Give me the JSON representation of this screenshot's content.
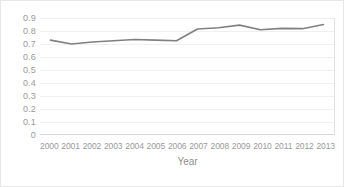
{
  "chart_data": {
    "type": "line",
    "title": "",
    "xlabel": "Year",
    "ylabel": "",
    "categories": [
      "2000",
      "2001",
      "2002",
      "2003",
      "2004",
      "2005",
      "2006",
      "2007",
      "2008",
      "2009",
      "2010",
      "2011",
      "2012",
      "2013"
    ],
    "values": [
      0.73,
      0.7,
      0.715,
      0.725,
      0.735,
      0.73,
      0.725,
      0.815,
      0.825,
      0.845,
      0.81,
      0.82,
      0.818,
      0.85
    ],
    "series": [
      {
        "name": "",
        "values": [
          0.73,
          0.7,
          0.715,
          0.725,
          0.735,
          0.73,
          0.725,
          0.815,
          0.825,
          0.845,
          0.81,
          0.82,
          0.818,
          0.85
        ]
      }
    ],
    "ylim": [
      0,
      0.9
    ],
    "yticks": [
      0,
      0.1,
      0.2,
      0.3,
      0.4,
      0.5,
      0.6,
      0.7,
      0.8,
      0.9
    ],
    "ytick_labels": [
      "0",
      "0.1",
      "0.2",
      "0.3",
      "0.4",
      "0.5",
      "0.6",
      "0.7",
      "0.8",
      "0.9"
    ],
    "grid": true,
    "legend": false,
    "legend_position": "none",
    "line_color": "#808080",
    "grid_color": "#f0f0f0",
    "axis_color": "#d9d9d9",
    "tick_label_color": "#9a9a9a"
  }
}
